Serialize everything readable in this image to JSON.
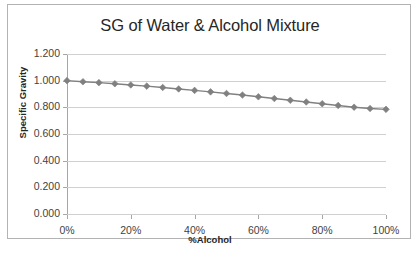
{
  "chart_data": {
    "type": "line",
    "title": "SG of Water & Alcohol Mixture",
    "xlabel": "%Alcohol",
    "ylabel": "Specific Gravity",
    "xlim": [
      0,
      100
    ],
    "ylim": [
      0.0,
      1.2
    ],
    "grid": true,
    "legend": "none",
    "marker": "diamond",
    "series_color": "#808080",
    "gridline_color": "#d0d0d0",
    "axis_color": "#a6a6a6",
    "frame_color": "#b3b3b3",
    "x_tick_labels": [
      "0%",
      "20%",
      "40%",
      "60%",
      "80%",
      "100%"
    ],
    "x_tick_values": [
      0,
      20,
      40,
      60,
      80,
      100
    ],
    "y_tick_labels": [
      "0.000",
      "0.200",
      "0.400",
      "0.600",
      "0.800",
      "1.000",
      "1.200"
    ],
    "y_tick_values": [
      0.0,
      0.2,
      0.4,
      0.6,
      0.8,
      1.0,
      1.2
    ],
    "x": [
      0,
      5,
      10,
      15,
      20,
      25,
      30,
      35,
      40,
      45,
      50,
      55,
      60,
      65,
      70,
      75,
      80,
      85,
      90,
      95,
      100
    ],
    "values": [
      1.0,
      0.992,
      0.985,
      0.977,
      0.968,
      0.959,
      0.949,
      0.938,
      0.927,
      0.916,
      0.904,
      0.892,
      0.879,
      0.866,
      0.853,
      0.84,
      0.827,
      0.814,
      0.801,
      0.791,
      0.785
    ]
  }
}
